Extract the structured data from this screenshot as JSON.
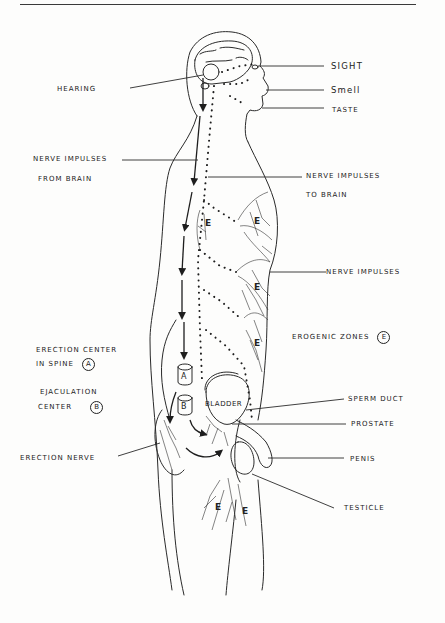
{
  "diagram": {
    "labels": {
      "hearing": "Hearing",
      "sight": "Sight",
      "smell": "Smell",
      "taste": "Taste",
      "nerve_from_brain_line1": "Nerve Impulses",
      "nerve_from_brain_line2": "From Brain",
      "nerve_to_brain_line1": "Nerve Impulses",
      "nerve_to_brain_line2": "To Brain",
      "nerve_impulses": "Nerve Impulses",
      "erogenic_zones": "Erogenic Zones",
      "erogenic_zones_marker": "E",
      "erection_center_line1": "Erection Center",
      "erection_center_line2": "in Spine",
      "erection_center_marker": "A",
      "ejaculation_center_line1": "Ejaculation",
      "ejaculation_center_line2": "Center",
      "ejaculation_center_marker": "B",
      "sperm_duct": "Sperm Duct",
      "prostate": "Prostate",
      "erection_nerve": "Erection Nerve",
      "penis": "Penis",
      "testicle": "Testicle"
    },
    "in_body": {
      "center_a": "A",
      "center_b": "B",
      "bladder": "BLADDER",
      "zone_marker": "E"
    },
    "legend": {
      "solid_arrows": "Nerve impulses from brain",
      "dotted_arrows": "Nerve impulses to brain"
    }
  }
}
